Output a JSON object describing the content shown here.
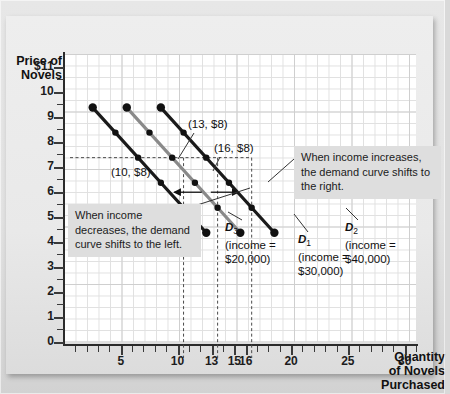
{
  "chart_data": {
    "type": "line",
    "title": "",
    "xlabel": "Quantity of Novels Purchased",
    "ylabel": "Price of Novels",
    "xlim": [
      0,
      31
    ],
    "ylim": [
      0,
      11.5
    ],
    "grid": true,
    "y_ticks": [
      "$11",
      "10",
      "9",
      "8",
      "7",
      "6",
      "5",
      "4",
      "3",
      "2",
      "1",
      "0"
    ],
    "y_tick_values": [
      11,
      10,
      9,
      8,
      7,
      6,
      5,
      4,
      3,
      2,
      1,
      0
    ],
    "x_ticks": [
      "5",
      "10",
      "13",
      "15",
      "16",
      "20",
      "25",
      "30"
    ],
    "x_tick_values": [
      5,
      10,
      13,
      15,
      16,
      20,
      25,
      30
    ],
    "series": [
      {
        "name": "D3",
        "label": "D3",
        "income": "$20,000",
        "color": "#1a1a1a",
        "points": [
          [
            2,
            10
          ],
          [
            4,
            9
          ],
          [
            6,
            8
          ],
          [
            8,
            7
          ],
          [
            10,
            6
          ],
          [
            12,
            5
          ]
        ],
        "labeled_point": "(10, $8)"
      },
      {
        "name": "D1",
        "label": "D1",
        "income": "$30,000",
        "color": "#8a8a8a",
        "points": [
          [
            5,
            10
          ],
          [
            7,
            9
          ],
          [
            9,
            8
          ],
          [
            11,
            7
          ],
          [
            13,
            6
          ],
          [
            15,
            5
          ]
        ],
        "labeled_point": "(13, $8)"
      },
      {
        "name": "D2",
        "label": "D2",
        "income": "$40,000",
        "color": "#1a1a1a",
        "points": [
          [
            8,
            10
          ],
          [
            10,
            9
          ],
          [
            12,
            8
          ],
          [
            14,
            7
          ],
          [
            16,
            6
          ],
          [
            18,
            5
          ]
        ],
        "labeled_point": "(16, $8)"
      }
    ],
    "annotations": [
      {
        "id": "point-10",
        "text": "(10, $8)"
      },
      {
        "id": "point-13",
        "text": "(13, $8)"
      },
      {
        "id": "point-16",
        "text": "(16, $8)"
      }
    ],
    "reference_lines": {
      "horizontal": [
        {
          "y": 8,
          "style": "dashed"
        }
      ],
      "vertical": [
        {
          "x": 10,
          "style": "dashed"
        },
        {
          "x": 13,
          "style": "dashed"
        },
        {
          "x": 16,
          "style": "dashed"
        }
      ]
    }
  },
  "axes": {
    "y_title_line1": "Price of",
    "y_title_line2": "Novels",
    "x_title_line1": "Quantity",
    "x_title_line2": "of Novels",
    "x_title_line3": "Purchased"
  },
  "callouts": {
    "increase": "When income increases, the demand curve shifts to the right.",
    "decrease": "When income decreases, the demand curve shifts to the left."
  },
  "curve_labels": {
    "d3_name": "D",
    "d3_sub": "3",
    "d3_income_line1": "(income =",
    "d3_income_line2": "$20,000)",
    "d1_name": "D",
    "d1_sub": "1",
    "d1_income_line1": "(income =",
    "d1_income_line2": "$30,000)",
    "d2_name": "D",
    "d2_sub": "2",
    "d2_income_line1": " (income =",
    "d2_income_line2": "$40,000)"
  },
  "point_labels": {
    "p10": "(10, $8)",
    "p13": "(13, $8)",
    "p16": "(16, $8)"
  },
  "colors": {
    "curve_dark": "#1a1a1a",
    "curve_gray": "#8a8a8a",
    "plot_bg": "#ffffff",
    "board_bg": "#e9e9e9",
    "callout_bg": "#dedede"
  }
}
